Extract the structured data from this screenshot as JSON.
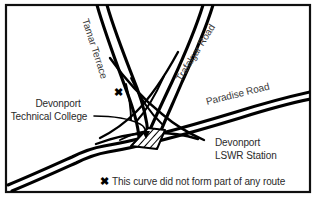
{
  "figure": {
    "kind": "scanned-line-map",
    "title_visible": false,
    "frame": {
      "border_color": "#101010",
      "background_color": "#ffffff"
    }
  },
  "map": {
    "ink_color": "#000000",
    "text_color": "#2a2a2a",
    "street_labels": [
      {
        "id": "tamar-terrace",
        "text": "Tamar Terrace",
        "orientation": "rotated",
        "angle_deg": 72
      },
      {
        "id": "trafalgar-road",
        "text": "Trafalgar Road",
        "orientation": "rotated",
        "angle_deg": -58
      },
      {
        "id": "paradise-road",
        "text": "Paradise Road",
        "orientation": "rotated",
        "angle_deg": -14
      }
    ],
    "place_labels": [
      {
        "id": "devonport-technical-college",
        "line1": "Devonport",
        "line2": "Technical College",
        "has_leader_line": true
      },
      {
        "id": "devonport-lswr-station",
        "line1": "Devonport",
        "line2": "LSWR Station",
        "has_leader_line": false
      }
    ],
    "markers": [
      {
        "id": "curve-marker",
        "glyph": "✖",
        "meaning": "disused-curve"
      }
    ],
    "building": {
      "id": "station-building",
      "fill": "hatched",
      "outline_color": "#000000"
    }
  },
  "caption": {
    "marker": "✖",
    "text": "This curve did not form part of any route"
  }
}
